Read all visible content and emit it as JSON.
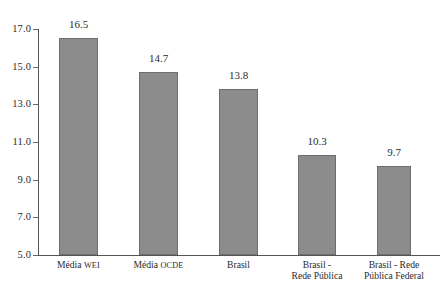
{
  "chart_data": {
    "type": "bar",
    "title": "",
    "subtitle": "",
    "xlabel": "",
    "ylabel": "",
    "ylim": [
      5.0,
      17.0
    ],
    "grid": false,
    "legend": "none",
    "bar_color": "#8c8c8c",
    "bar_border_color": "#6d6d6d",
    "axis_color": "#555555",
    "y_ticks": [
      "17.0",
      "15.0",
      "13.0",
      "11.0",
      "9.0",
      "7.0",
      "5.0"
    ],
    "y_tick_values": [
      17.0,
      15.0,
      13.0,
      11.0,
      9.0,
      7.0,
      5.0
    ],
    "categories": [
      "Média WEI",
      "Média OCDE",
      "Brasil",
      "Brasil - Rede Pública",
      "Brasil - Rede Pública Federal"
    ],
    "category_lines": [
      [
        "Média ",
        "WEI"
      ],
      [
        "Média ",
        "OCDE"
      ],
      [
        "Brasil",
        ""
      ],
      [
        "Brasil -",
        "Rede Pública"
      ],
      [
        "Brasil - Rede",
        "Pública Federal"
      ]
    ],
    "values": [
      16.5,
      14.7,
      13.8,
      10.3,
      9.7
    ],
    "value_labels": [
      "16.5",
      "14.7",
      "13.8",
      "10.3",
      "9.7"
    ]
  }
}
